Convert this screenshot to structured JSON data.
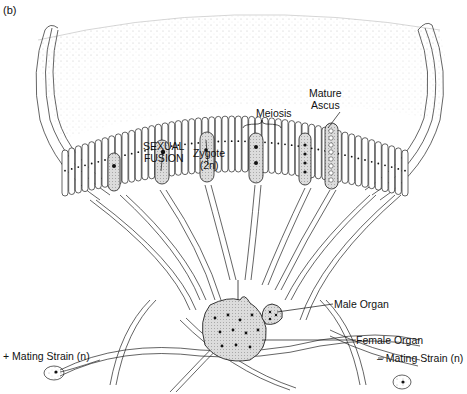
{
  "figure": {
    "panel_label": "(b)",
    "labels": {
      "sexual_fusion_line1": "SEXUAL",
      "sexual_fusion_line2": "FUSION",
      "zygote_line1": "Zygote",
      "zygote_line2": "(2n)",
      "meiosis": "Meiosis",
      "mature_ascus_line1": "Mature",
      "mature_ascus_line2": "Ascus",
      "male_organ": "Male Organ",
      "female_organ": "Female Organ",
      "minus_strain": "– Mating Strain (n)",
      "plus_strain": "+ Mating Strain (n)"
    },
    "colors": {
      "ink": "#1a1a1a",
      "stipple": "#9a9a9a",
      "shaded": "#d6d6d6"
    }
  }
}
